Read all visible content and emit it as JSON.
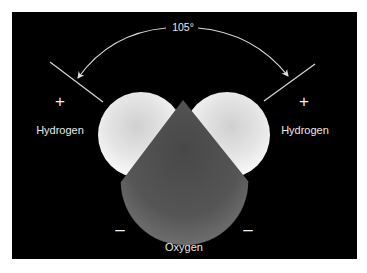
{
  "figure": {
    "bond_angle": "105°",
    "atoms": {
      "left_hydrogen": {
        "label": "Hydrogen",
        "charge": "+"
      },
      "right_hydrogen": {
        "label": "Hydrogen",
        "charge": "+"
      },
      "oxygen": {
        "label": "Oxygen",
        "charge_left": "–",
        "charge_right": "–"
      }
    },
    "colors": {
      "background": "#000000",
      "hydrogen_fill": "#e6e6e6",
      "oxygen_fill": "#5a5a5a",
      "text": "#e8e8e8",
      "frame": "#ffffff"
    }
  }
}
